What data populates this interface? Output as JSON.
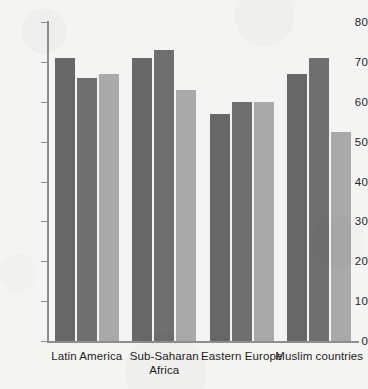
{
  "chart_data": {
    "type": "bar",
    "title": "",
    "subtitle": "",
    "xlabel": "",
    "ylabel": "",
    "ylim": [
      0,
      80
    ],
    "ytick_step": 10,
    "yticks": [
      80,
      70,
      60,
      50,
      40,
      30,
      20,
      10,
      0
    ],
    "grid": false,
    "legend": "none",
    "orientation": "vertical",
    "grouping": "grouped",
    "categories": [
      "Latin America",
      "Sub-Saharan Africa",
      "Eastern Europe",
      "Muslim countries"
    ],
    "category_lines": [
      [
        "Latin America"
      ],
      [
        "Sub-Saharan",
        "Africa"
      ],
      [
        "Eastern Europe"
      ],
      [
        "Muslim countries"
      ]
    ],
    "series": [
      {
        "name": "Series 1",
        "color": "#676767",
        "values": [
          71,
          71,
          57,
          67
        ]
      },
      {
        "name": "Series 2",
        "color": "#6f6f6f",
        "values": [
          66,
          73,
          60,
          71
        ]
      },
      {
        "name": "Series 3",
        "color": "#a9a9a9",
        "values": [
          67,
          63,
          60,
          52.5
        ]
      }
    ]
  },
  "colors": {
    "background": "#f4f4f2",
    "axis": "#8e8e8e",
    "text": "#1d1d1d",
    "series_1": "#676767",
    "series_2": "#6f6f6f",
    "series_3": "#a9a9a9"
  }
}
